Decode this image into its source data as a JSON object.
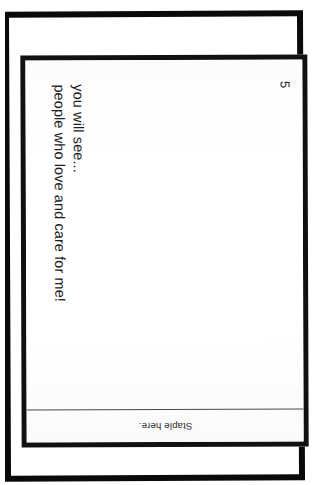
{
  "document": {
    "type": "scanned-booklet-page",
    "orientation": "rotated-90-clockwise",
    "page_number": "5",
    "background_color": "#ffffff",
    "ink_color": "#1a1a1a"
  },
  "body": {
    "lines": [
      "you will see...",
      "people who love and care for me!"
    ]
  },
  "staple": {
    "label": "Staple here."
  }
}
